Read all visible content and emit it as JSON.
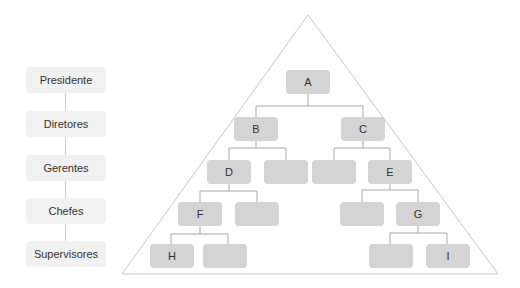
{
  "levels": [
    "Presidente",
    "Diretores",
    "Gerentes",
    "Chefes",
    "Supervisores"
  ],
  "nodes": {
    "A": "A",
    "B": "B",
    "C": "C",
    "D": "D",
    "E": "E",
    "F": "F",
    "G": "G",
    "H": "H",
    "I": "I"
  },
  "colors": {
    "node": "#d4d4d4",
    "level": "#f1f1f1",
    "line": "#a9a9a9",
    "triangle": "#c8c8c8"
  }
}
